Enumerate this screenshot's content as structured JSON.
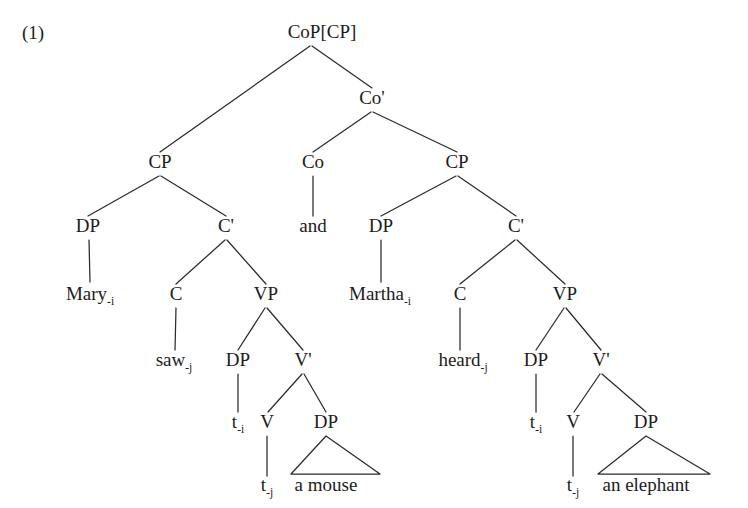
{
  "figure": {
    "example_number": "(1)",
    "type": "syntax-tree",
    "ink_color": "#1c1c1c",
    "background_color": "#ffffff"
  },
  "tree": {
    "nodes": [
      {
        "id": "root",
        "label": "CoP[CP]",
        "sub": "",
        "x": 322,
        "y": 38,
        "kind": "category"
      },
      {
        "id": "coprime",
        "label": "Co'",
        "sub": "",
        "x": 372,
        "y": 104,
        "kind": "category"
      },
      {
        "id": "cp-left",
        "label": "CP",
        "sub": "",
        "x": 160,
        "y": 168,
        "kind": "category"
      },
      {
        "id": "co-head",
        "label": "Co",
        "sub": "",
        "x": 313,
        "y": 168,
        "kind": "category"
      },
      {
        "id": "cp-right",
        "label": "CP",
        "sub": "",
        "x": 457,
        "y": 168,
        "kind": "category"
      },
      {
        "id": "dp-left",
        "label": "DP",
        "sub": "",
        "x": 88,
        "y": 232,
        "kind": "category"
      },
      {
        "id": "cbar-left",
        "label": "C'",
        "sub": "",
        "x": 226,
        "y": 232,
        "kind": "category"
      },
      {
        "id": "and",
        "label": "and",
        "sub": "",
        "x": 313,
        "y": 232,
        "kind": "terminal"
      },
      {
        "id": "dp-right",
        "label": "DP",
        "sub": "",
        "x": 381,
        "y": 232,
        "kind": "category"
      },
      {
        "id": "cbar-right",
        "label": "C'",
        "sub": "",
        "x": 516,
        "y": 232,
        "kind": "category"
      },
      {
        "id": "mary",
        "label": "Mary",
        "sub": "-i",
        "x": 90,
        "y": 300,
        "kind": "terminal"
      },
      {
        "id": "c-left",
        "label": "C",
        "sub": "",
        "x": 176,
        "y": 300,
        "kind": "category"
      },
      {
        "id": "vp-left",
        "label": "VP",
        "sub": "",
        "x": 266,
        "y": 300,
        "kind": "category"
      },
      {
        "id": "martha",
        "label": "Martha",
        "sub": "-i",
        "x": 380,
        "y": 300,
        "kind": "terminal"
      },
      {
        "id": "c-right",
        "label": "C",
        "sub": "",
        "x": 460,
        "y": 300,
        "kind": "category"
      },
      {
        "id": "vp-right",
        "label": "VP",
        "sub": "",
        "x": 565,
        "y": 300,
        "kind": "category"
      },
      {
        "id": "saw",
        "label": "saw",
        "sub": "-j",
        "x": 174,
        "y": 366,
        "kind": "terminal"
      },
      {
        "id": "dp-obj-left",
        "label": "DP",
        "sub": "",
        "x": 238,
        "y": 366,
        "kind": "category"
      },
      {
        "id": "vbar-left",
        "label": "V'",
        "sub": "",
        "x": 303,
        "y": 366,
        "kind": "category"
      },
      {
        "id": "heard",
        "label": "heard",
        "sub": "-j",
        "x": 463,
        "y": 366,
        "kind": "terminal"
      },
      {
        "id": "dp-obj-right",
        "label": "DP",
        "sub": "",
        "x": 536,
        "y": 366,
        "kind": "category"
      },
      {
        "id": "vbar-right",
        "label": "V'",
        "sub": "",
        "x": 601,
        "y": 366,
        "kind": "category"
      },
      {
        "id": "trace-i-left",
        "label": "t",
        "sub": "-i",
        "x": 238,
        "y": 428,
        "kind": "trace"
      },
      {
        "id": "v-left",
        "label": "V",
        "sub": "",
        "x": 267,
        "y": 428,
        "kind": "category"
      },
      {
        "id": "dp-comp-left",
        "label": "DP",
        "sub": "",
        "x": 326,
        "y": 428,
        "kind": "category"
      },
      {
        "id": "trace-i-right",
        "label": "t",
        "sub": "-i",
        "x": 536,
        "y": 428,
        "kind": "trace"
      },
      {
        "id": "v-right",
        "label": "V",
        "sub": "",
        "x": 573,
        "y": 428,
        "kind": "category"
      },
      {
        "id": "dp-comp-right",
        "label": "DP",
        "sub": "",
        "x": 646,
        "y": 428,
        "kind": "category"
      },
      {
        "id": "trace-j-left",
        "label": "t",
        "sub": "-j",
        "x": 267,
        "y": 491,
        "kind": "trace"
      },
      {
        "id": "a-mouse",
        "label": "a mouse",
        "sub": "",
        "x": 326,
        "y": 491,
        "kind": "terminal"
      },
      {
        "id": "trace-j-right",
        "label": "t",
        "sub": "-j",
        "x": 573,
        "y": 491,
        "kind": "trace"
      },
      {
        "id": "an-elephant",
        "label": "an elephant",
        "sub": "",
        "x": 646,
        "y": 491,
        "kind": "terminal"
      }
    ],
    "branches": [
      {
        "from": "root",
        "to": "cp-left",
        "x1": 310,
        "y1": 46,
        "x2": 160,
        "y2": 152
      },
      {
        "from": "root",
        "to": "coprime",
        "x1": 312,
        "y1": 46,
        "x2": 372,
        "y2": 88
      },
      {
        "from": "coprime",
        "to": "co-head",
        "x1": 371,
        "y1": 112,
        "x2": 313,
        "y2": 152
      },
      {
        "from": "coprime",
        "to": "cp-right",
        "x1": 373,
        "y1": 112,
        "x2": 457,
        "y2": 152
      },
      {
        "from": "cp-left",
        "to": "dp-left",
        "x1": 159,
        "y1": 176,
        "x2": 88,
        "y2": 216
      },
      {
        "from": "cp-left",
        "to": "cbar-left",
        "x1": 161,
        "y1": 176,
        "x2": 226,
        "y2": 216
      },
      {
        "from": "co-head",
        "to": "and",
        "x1": 313,
        "y1": 176,
        "x2": 313,
        "y2": 216
      },
      {
        "from": "cp-right",
        "to": "dp-right",
        "x1": 456,
        "y1": 176,
        "x2": 381,
        "y2": 216
      },
      {
        "from": "cp-right",
        "to": "cbar-right",
        "x1": 458,
        "y1": 176,
        "x2": 516,
        "y2": 216
      },
      {
        "from": "dp-left",
        "to": "mary",
        "x1": 89,
        "y1": 240,
        "x2": 90,
        "y2": 282
      },
      {
        "from": "cbar-left",
        "to": "c-left",
        "x1": 225,
        "y1": 240,
        "x2": 176,
        "y2": 284
      },
      {
        "from": "cbar-left",
        "to": "vp-left",
        "x1": 227,
        "y1": 240,
        "x2": 266,
        "y2": 284
      },
      {
        "from": "dp-right",
        "to": "martha",
        "x1": 381,
        "y1": 240,
        "x2": 381,
        "y2": 282
      },
      {
        "from": "cbar-right",
        "to": "c-right",
        "x1": 515,
        "y1": 240,
        "x2": 460,
        "y2": 284
      },
      {
        "from": "cbar-right",
        "to": "vp-right",
        "x1": 517,
        "y1": 240,
        "x2": 565,
        "y2": 284
      },
      {
        "from": "c-left",
        "to": "saw",
        "x1": 176,
        "y1": 308,
        "x2": 175,
        "y2": 350
      },
      {
        "from": "vp-left",
        "to": "dp-obj-left",
        "x1": 265,
        "y1": 308,
        "x2": 238,
        "y2": 350
      },
      {
        "from": "vp-left",
        "to": "vbar-left",
        "x1": 267,
        "y1": 308,
        "x2": 303,
        "y2": 350
      },
      {
        "from": "c-right",
        "to": "heard",
        "x1": 460,
        "y1": 308,
        "x2": 460,
        "y2": 350
      },
      {
        "from": "vp-right",
        "to": "dp-obj-right",
        "x1": 564,
        "y1": 308,
        "x2": 536,
        "y2": 350
      },
      {
        "from": "vp-right",
        "to": "vbar-right",
        "x1": 566,
        "y1": 308,
        "x2": 601,
        "y2": 350
      },
      {
        "from": "dp-obj-left",
        "to": "trace-i-left",
        "x1": 238,
        "y1": 374,
        "x2": 238,
        "y2": 412
      },
      {
        "from": "vbar-left",
        "to": "v-left",
        "x1": 302,
        "y1": 374,
        "x2": 268,
        "y2": 412
      },
      {
        "from": "vbar-left",
        "to": "dp-comp-left",
        "x1": 304,
        "y1": 374,
        "x2": 326,
        "y2": 412
      },
      {
        "from": "dp-obj-right",
        "to": "trace-i-right",
        "x1": 536,
        "y1": 374,
        "x2": 536,
        "y2": 412
      },
      {
        "from": "vbar-right",
        "to": "v-right",
        "x1": 600,
        "y1": 374,
        "x2": 574,
        "y2": 412
      },
      {
        "from": "vbar-right",
        "to": "dp-comp-right",
        "x1": 602,
        "y1": 374,
        "x2": 646,
        "y2": 412
      },
      {
        "from": "v-left",
        "to": "trace-j-left",
        "x1": 267,
        "y1": 436,
        "x2": 267,
        "y2": 476
      },
      {
        "from": "v-right",
        "to": "trace-j-right",
        "x1": 573,
        "y1": 436,
        "x2": 573,
        "y2": 476
      }
    ],
    "triangles": [
      {
        "parent": "dp-comp-left",
        "apex_x": 326,
        "apex_y": 436,
        "left_x": 291,
        "right_x": 380,
        "base_y": 474
      },
      {
        "parent": "dp-comp-right",
        "apex_x": 646,
        "apex_y": 436,
        "left_x": 598,
        "right_x": 710,
        "base_y": 474
      }
    ]
  }
}
